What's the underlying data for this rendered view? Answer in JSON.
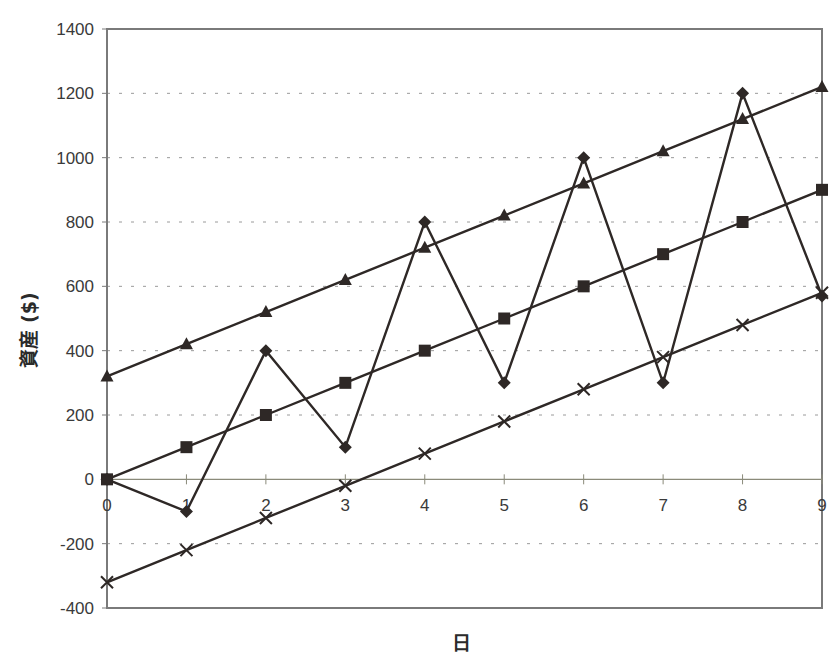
{
  "chart_data": {
    "type": "line",
    "title": "",
    "xlabel": "日",
    "ylabel": "資産 ($)",
    "x": [
      0,
      1,
      2,
      3,
      4,
      5,
      6,
      7,
      8,
      9
    ],
    "xlim": [
      0,
      9
    ],
    "ylim": [
      -400,
      1400
    ],
    "yticks": [
      -400,
      -200,
      0,
      200,
      400,
      600,
      800,
      1000,
      1200,
      1400
    ],
    "xticks": [
      0,
      1,
      2,
      3,
      4,
      5,
      6,
      7,
      8,
      9
    ],
    "grid": "horizontal dashed",
    "legend": "none",
    "series": [
      {
        "name": "triangle",
        "marker": "triangle",
        "values": [
          320,
          420,
          520,
          620,
          720,
          820,
          920,
          1020,
          1120,
          1220
        ]
      },
      {
        "name": "square",
        "marker": "square",
        "values": [
          0,
          100,
          200,
          300,
          400,
          500,
          600,
          700,
          800,
          900
        ]
      },
      {
        "name": "diamond",
        "marker": "diamond",
        "values": [
          0,
          -100,
          400,
          100,
          800,
          300,
          1000,
          300,
          1200,
          570
        ]
      },
      {
        "name": "cross",
        "marker": "x",
        "values": [
          -320,
          -220,
          -120,
          -20,
          80,
          180,
          280,
          380,
          480,
          580
        ]
      }
    ]
  },
  "colors": {
    "line": "#2e2826",
    "marker": "#2e2826",
    "frame": "#7a7a7a",
    "grid": "#9a9a9a",
    "zero_axis": "#8a8a7a"
  }
}
